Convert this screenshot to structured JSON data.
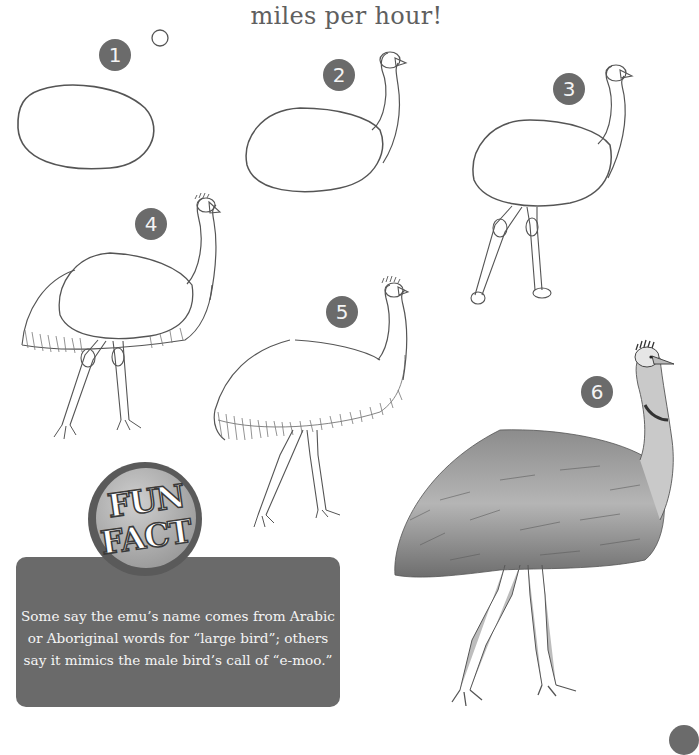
{
  "page": {
    "title_fragment": "miles per hour!"
  },
  "steps": [
    {
      "number": "1"
    },
    {
      "number": "2"
    },
    {
      "number": "3"
    },
    {
      "number": "4"
    },
    {
      "number": "5"
    },
    {
      "number": "6"
    }
  ],
  "fun_fact": {
    "badge_line1": "FUN",
    "badge_line2": "FACT",
    "text": "Some say the emu’s name comes from Arabic or Aboriginal words for “large bird”; others say it mimics the male bird’s call of “e-moo.”"
  },
  "colors": {
    "badge_gray": "#6b6b6b",
    "fact_box_gray": "#6a6a6a",
    "title_gray": "#5f5f5f",
    "line_gray": "#555555"
  }
}
